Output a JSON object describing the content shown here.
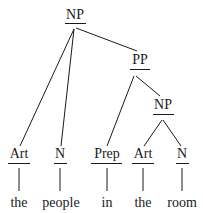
{
  "diagram": {
    "type": "syntax-tree",
    "nodes": {
      "np_root": "NP",
      "pp": "PP",
      "np_inner": "NP",
      "art1": "Art",
      "n1": "N",
      "prep": "Prep",
      "art2": "Art",
      "n2": "N"
    },
    "words": {
      "w1": "the",
      "w2": "people",
      "w3": "in",
      "w4": "the",
      "w5": "room"
    },
    "edges": [
      [
        "NP",
        "Art"
      ],
      [
        "NP",
        "N"
      ],
      [
        "NP",
        "PP"
      ],
      [
        "PP",
        "Prep"
      ],
      [
        "PP",
        "NP"
      ],
      [
        "NP",
        "Art"
      ],
      [
        "NP",
        "N"
      ],
      [
        "Art",
        "the"
      ],
      [
        "N",
        "people"
      ],
      [
        "Prep",
        "in"
      ],
      [
        "Art",
        "the"
      ],
      [
        "N",
        "room"
      ]
    ],
    "colors": {
      "ink": "#1a1a1a",
      "background": "#ffffff"
    }
  }
}
